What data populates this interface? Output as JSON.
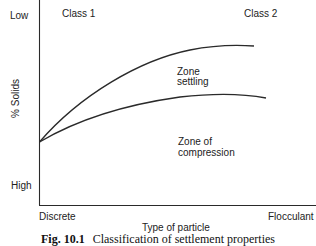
{
  "figure": {
    "caption_number": "Fig. 10.1",
    "caption_text": "Classification of settlement properties",
    "y_axis": {
      "label": "% Solids",
      "top_label": "Low",
      "bottom_label": "High"
    },
    "x_axis": {
      "label": "Type of particle",
      "left_label": "Discrete",
      "right_label": "Flocculant"
    },
    "class_labels": [
      "Class 1",
      "Class 2"
    ],
    "region_labels": {
      "zone_settling_line1": "Zone",
      "zone_settling_line2": "settling",
      "compression_line1": "Zone of",
      "compression_line2": "compression"
    },
    "curves": [
      {
        "name": "upper-boundary",
        "description": "Boundary between Class 1/zone settling (upper curve)"
      },
      {
        "name": "lower-boundary",
        "description": "Boundary between zone settling and zone of compression"
      }
    ],
    "colors": {
      "line": "#2a2a2a",
      "background": "#ffffff"
    }
  }
}
